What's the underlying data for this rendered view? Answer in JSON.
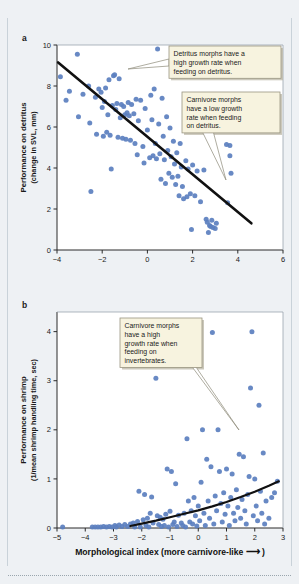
{
  "figure": {
    "background_color": "#eef1f4",
    "marker_color": "#5b7fbf",
    "line_color": "#111111",
    "callout_fill": "#f7f3df",
    "callout_border": "#9a9580"
  },
  "panels": [
    {
      "label": "a",
      "ylabel_line1": "Performance on detritus",
      "ylabel_line2": "(change in SVL, mm)",
      "xlabel": "",
      "callouts": [
        {
          "name": "callout-detritus-high",
          "lines": [
            "Detritus morphs have a",
            "high growth rate when",
            "feeding on detritus."
          ]
        },
        {
          "name": "callout-carnivore-low",
          "lines": [
            "Carnivore morphs",
            "have a low growth",
            "rate when feeding",
            "on detritus."
          ]
        }
      ]
    },
    {
      "label": "b",
      "ylabel_line1": "Performance on shrimp",
      "ylabel_line2": "(1/mean shrimp handling time, sec)",
      "xlabel_text": "Morphological index (more carnivore-like",
      "xlabel_arrow": "⟶",
      "xlabel_close": ")",
      "callouts": [
        {
          "name": "callout-carnivore-high",
          "lines": [
            "Carnivore morphs",
            "have a high",
            "growth rate when",
            "feeding on",
            "invertebrates."
          ]
        }
      ]
    }
  ],
  "chart_data": [
    {
      "type": "scatter",
      "panel": "a",
      "title": "",
      "xlabel": "Morphological index (more carnivore-like ⟶ )",
      "ylabel": "Performance on detritus (change in SVL, mm)",
      "xlim": [
        -4,
        6
      ],
      "ylim": [
        0,
        10
      ],
      "xticks": [
        -4,
        -2,
        0,
        2,
        4,
        6
      ],
      "yticks": [
        0,
        2,
        4,
        6,
        8,
        10
      ],
      "grid": false,
      "legend": "none",
      "trendline": {
        "type": "linear",
        "x": [
          -3.95,
          4.6
        ],
        "y": [
          9.15,
          1.3
        ]
      },
      "points": [
        [
          -3.85,
          8.45
        ],
        [
          -3.6,
          7.3
        ],
        [
          -3.45,
          7.75
        ],
        [
          -3.1,
          9.55
        ],
        [
          -3.05,
          6.5
        ],
        [
          -2.85,
          7.6
        ],
        [
          -2.6,
          8.0
        ],
        [
          -2.55,
          6.2
        ],
        [
          -2.5,
          2.85
        ],
        [
          -2.3,
          7.45
        ],
        [
          -2.25,
          5.65
        ],
        [
          -2.15,
          7.85
        ],
        [
          -2.05,
          7.7
        ],
        [
          -2.0,
          6.95
        ],
        [
          -1.95,
          5.55
        ],
        [
          -1.9,
          7.25
        ],
        [
          -1.85,
          7.9
        ],
        [
          -1.8,
          5.75
        ],
        [
          -1.75,
          6.6
        ],
        [
          -1.7,
          8.3
        ],
        [
          -1.65,
          5.6
        ],
        [
          -1.6,
          3.95
        ],
        [
          -1.55,
          7.05
        ],
        [
          -1.5,
          8.5
        ],
        [
          -1.45,
          8.55
        ],
        [
          -1.4,
          6.85
        ],
        [
          -1.35,
          7.15
        ],
        [
          -1.3,
          5.5
        ],
        [
          -1.25,
          8.35
        ],
        [
          -1.2,
          6.45
        ],
        [
          -1.15,
          7.1
        ],
        [
          -1.1,
          5.45
        ],
        [
          -1.05,
          7.0
        ],
        [
          -1.0,
          6.6
        ],
        [
          -0.95,
          5.4
        ],
        [
          -0.9,
          6.7
        ],
        [
          -0.85,
          7.2
        ],
        [
          -0.8,
          6.55
        ],
        [
          -0.75,
          5.35
        ],
        [
          -0.7,
          7.1
        ],
        [
          -0.6,
          6.65
        ],
        [
          -0.55,
          5.2
        ],
        [
          -0.5,
          7.35
        ],
        [
          -0.45,
          4.65
        ],
        [
          -0.4,
          6.3
        ],
        [
          -0.3,
          7.3
        ],
        [
          -0.2,
          5.05
        ],
        [
          -0.15,
          4.25
        ],
        [
          -0.1,
          6.9
        ],
        [
          0.0,
          5.85
        ],
        [
          0.1,
          4.5
        ],
        [
          0.15,
          7.55
        ],
        [
          0.2,
          6.35
        ],
        [
          0.25,
          4.6
        ],
        [
          0.3,
          7.85
        ],
        [
          0.35,
          5.2
        ],
        [
          0.4,
          4.45
        ],
        [
          0.45,
          9.8
        ],
        [
          0.5,
          6.15
        ],
        [
          0.55,
          4.7
        ],
        [
          0.6,
          3.45
        ],
        [
          0.65,
          7.4
        ],
        [
          0.7,
          5.55
        ],
        [
          0.75,
          4.4
        ],
        [
          0.8,
          3.25
        ],
        [
          0.85,
          6.5
        ],
        [
          0.9,
          4.85
        ],
        [
          0.95,
          3.75
        ],
        [
          1.0,
          5.95
        ],
        [
          1.05,
          4.55
        ],
        [
          1.1,
          3.55
        ],
        [
          1.15,
          5.3
        ],
        [
          1.2,
          4.2
        ],
        [
          1.25,
          3.2
        ],
        [
          1.3,
          4.75
        ],
        [
          1.35,
          3.6
        ],
        [
          1.4,
          2.65
        ],
        [
          1.45,
          5.2
        ],
        [
          1.5,
          4.05
        ],
        [
          1.55,
          3.1
        ],
        [
          1.6,
          2.5
        ],
        [
          1.7,
          4.35
        ],
        [
          1.75,
          2.6
        ],
        [
          1.8,
          3.95
        ],
        [
          1.9,
          2.75
        ],
        [
          1.95,
          1.0
        ],
        [
          2.0,
          4.15
        ],
        [
          2.1,
          2.65
        ],
        [
          2.2,
          3.85
        ],
        [
          2.35,
          2.35
        ],
        [
          2.5,
          3.9
        ],
        [
          2.6,
          1.5
        ],
        [
          2.65,
          1.35
        ],
        [
          2.7,
          0.85
        ],
        [
          2.75,
          1.2
        ],
        [
          2.8,
          1.15
        ],
        [
          2.85,
          1.45
        ],
        [
          2.9,
          1.1
        ],
        [
          3.0,
          1.05
        ],
        [
          3.05,
          1.3
        ],
        [
          3.5,
          5.15
        ],
        [
          3.55,
          2.3
        ],
        [
          3.65,
          5.1
        ],
        [
          3.7,
          3.75
        ],
        [
          3.65,
          4.6
        ]
      ]
    },
    {
      "type": "scatter",
      "panel": "b",
      "title": "",
      "xlabel": "Morphological index (more carnivore-like ⟶ )",
      "ylabel": "Performance on shrimp (1/mean shrimp handling time, sec)",
      "xlim": [
        -5,
        3
      ],
      "ylim": [
        0,
        4.4
      ],
      "xticks": [
        -5,
        -4,
        -3,
        -2,
        -1,
        0,
        1,
        2,
        3
      ],
      "yticks": [
        0,
        1,
        2,
        3,
        4
      ],
      "grid": false,
      "legend": "none",
      "trendline": {
        "type": "curve",
        "x": [
          -2.4,
          -2.0,
          -1.5,
          -1.0,
          -0.5,
          0.0,
          0.5,
          1.0,
          1.5,
          2.0,
          2.5,
          2.85
        ],
        "y": [
          0.04,
          0.09,
          0.15,
          0.22,
          0.29,
          0.36,
          0.44,
          0.53,
          0.63,
          0.74,
          0.86,
          0.95
        ]
      },
      "points": [
        [
          -4.8,
          0.02
        ],
        [
          -3.75,
          0.02
        ],
        [
          -3.65,
          0.02
        ],
        [
          -3.55,
          0.02
        ],
        [
          -3.45,
          0.02
        ],
        [
          -3.35,
          0.03
        ],
        [
          -3.25,
          0.02
        ],
        [
          -3.15,
          0.03
        ],
        [
          -3.05,
          0.02
        ],
        [
          -2.95,
          0.05
        ],
        [
          -2.9,
          0.02
        ],
        [
          -2.8,
          0.06
        ],
        [
          -2.7,
          0.03
        ],
        [
          -2.6,
          0.07
        ],
        [
          -2.5,
          0.03
        ],
        [
          -2.4,
          0.08
        ],
        [
          -2.3,
          0.1
        ],
        [
          -2.25,
          0.02
        ],
        [
          -2.15,
          0.13
        ],
        [
          -2.1,
          0.75
        ],
        [
          -2.05,
          0.02
        ],
        [
          -1.95,
          0.17
        ],
        [
          -1.9,
          0.68
        ],
        [
          -1.85,
          0.05
        ],
        [
          -1.8,
          0.2
        ],
        [
          -1.75,
          0.02
        ],
        [
          -1.7,
          0.3
        ],
        [
          -1.65,
          0.63
        ],
        [
          -1.6,
          0.1
        ],
        [
          -1.5,
          3.05
        ],
        [
          -1.45,
          0.25
        ],
        [
          -1.4,
          0.07
        ],
        [
          -1.35,
          0.22
        ],
        [
          -1.3,
          0.03
        ],
        [
          -1.25,
          0.18
        ],
        [
          -1.2,
          0.05
        ],
        [
          -1.15,
          0.28
        ],
        [
          -1.1,
          1.2
        ],
        [
          -1.05,
          0.02
        ],
        [
          -1.0,
          0.34
        ],
        [
          -0.95,
          1.15
        ],
        [
          -0.9,
          0.07
        ],
        [
          -0.85,
          0.12
        ],
        [
          -0.8,
          0.9
        ],
        [
          -0.75,
          0.03
        ],
        [
          -0.7,
          0.26
        ],
        [
          -0.6,
          0.1
        ],
        [
          -0.55,
          0.05
        ],
        [
          -0.5,
          0.3
        ],
        [
          -0.45,
          0.02
        ],
        [
          -0.4,
          1.82
        ],
        [
          -0.35,
          0.55
        ],
        [
          -0.3,
          0.12
        ],
        [
          -0.25,
          0.35
        ],
        [
          -0.2,
          0.08
        ],
        [
          -0.15,
          0.62
        ],
        [
          -0.1,
          0.25
        ],
        [
          -0.05,
          0.04
        ],
        [
          0.0,
          0.45
        ],
        [
          0.05,
          0.15
        ],
        [
          0.1,
          0.93
        ],
        [
          0.15,
          2.0
        ],
        [
          0.2,
          0.3
        ],
        [
          0.25,
          0.05
        ],
        [
          0.3,
          1.4
        ],
        [
          0.35,
          0.55
        ],
        [
          0.4,
          0.2
        ],
        [
          0.45,
          1.25
        ],
        [
          0.5,
          3.98
        ],
        [
          0.55,
          0.08
        ],
        [
          0.6,
          0.65
        ],
        [
          0.65,
          0.35
        ],
        [
          0.7,
          2.0
        ],
        [
          0.75,
          1.15
        ],
        [
          0.8,
          0.5
        ],
        [
          0.85,
          0.12
        ],
        [
          0.9,
          0.72
        ],
        [
          0.95,
          0.28
        ],
        [
          1.0,
          1.2
        ],
        [
          1.05,
          0.45
        ],
        [
          1.1,
          0.05
        ],
        [
          1.15,
          0.62
        ],
        [
          1.2,
          1.1
        ],
        [
          1.25,
          0.3
        ],
        [
          1.3,
          0.15
        ],
        [
          1.35,
          0.78
        ],
        [
          1.4,
          0.42
        ],
        [
          1.45,
          1.5
        ],
        [
          1.5,
          0.2
        ],
        [
          1.55,
          0.58
        ],
        [
          1.6,
          1.45
        ],
        [
          1.65,
          0.35
        ],
        [
          1.7,
          0.08
        ],
        [
          1.75,
          0.68
        ],
        [
          1.8,
          1.05
        ],
        [
          1.85,
          2.85
        ],
        [
          1.9,
          4.0
        ],
        [
          1.95,
          0.25
        ],
        [
          2.0,
          1.0
        ],
        [
          2.05,
          0.45
        ],
        [
          2.1,
          0.15
        ],
        [
          2.15,
          2.5
        ],
        [
          2.2,
          0.75
        ],
        [
          2.25,
          0.3
        ],
        [
          2.3,
          1.53
        ],
        [
          2.35,
          0.08
        ],
        [
          2.4,
          0.55
        ],
        [
          2.5,
          0.2
        ],
        [
          2.6,
          0.62
        ],
        [
          2.7,
          0.72
        ],
        [
          2.8,
          0.95
        ]
      ]
    }
  ]
}
